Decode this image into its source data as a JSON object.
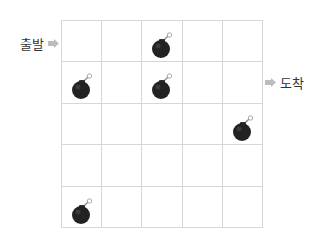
{
  "labels": {
    "start": "출발",
    "end": "도착"
  },
  "grid": {
    "rows": 5,
    "cols": 5,
    "start_row": 0,
    "end_row": 1,
    "bombs": [
      {
        "row": 0,
        "col": 2
      },
      {
        "row": 1,
        "col": 0
      },
      {
        "row": 1,
        "col": 2
      },
      {
        "row": 2,
        "col": 4
      },
      {
        "row": 4,
        "col": 0
      }
    ]
  },
  "icons": {
    "bomb": "bomb-icon",
    "arrow": "arrow-right-icon"
  },
  "colors": {
    "grid_line": "#d6d6d6",
    "bomb_body": "#222222",
    "arrow": "#bdbdbd",
    "text": "#333333"
  }
}
